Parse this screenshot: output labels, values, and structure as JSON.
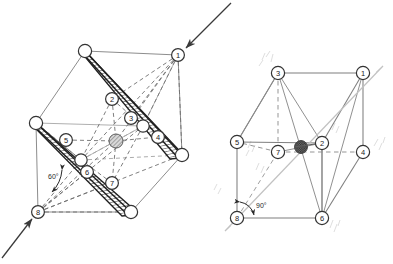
{
  "figure": {
    "background_color": "#ffffff",
    "width": 393,
    "height": 264,
    "line_color": "#555555",
    "dash_color": "#707070",
    "band_color": "#1a1a1a",
    "node_fill": "#ffffff",
    "node_stroke": "#333333",
    "center_atom_color_left": "#8a8a8a",
    "center_atom_color_right": "#4a4a4a",
    "arrow_color": "#3a3a3a"
  },
  "left_cell": {
    "name": "left-unit-cell",
    "angle_label": "60°",
    "incoming_arrow_top_label": "",
    "incoming_arrow_bottom_label": "",
    "numbered_nodes": [
      {
        "id": "1",
        "label": "1",
        "x": 178,
        "y": 55
      },
      {
        "id": "2",
        "label": "2",
        "x": 112,
        "y": 99
      },
      {
        "id": "3",
        "label": "3",
        "x": 131,
        "y": 118
      },
      {
        "id": "4",
        "label": "4",
        "x": 158,
        "y": 137
      },
      {
        "id": "5",
        "label": "5",
        "x": 66,
        "y": 140
      },
      {
        "id": "6",
        "label": "6",
        "x": 87,
        "y": 172
      },
      {
        "id": "7",
        "label": "7",
        "x": 112,
        "y": 183
      },
      {
        "id": "8",
        "label": "8",
        "x": 38,
        "y": 212
      }
    ],
    "corner_nodes": [
      {
        "id": "top",
        "x": 85,
        "y": 51
      },
      {
        "id": "upper-left",
        "x": 36,
        "y": 123
      },
      {
        "id": "right",
        "x": 182,
        "y": 155
      },
      {
        "id": "mid-right",
        "x": 143,
        "y": 126
      },
      {
        "id": "mid-left",
        "x": 81,
        "y": 160
      },
      {
        "id": "bottom",
        "x": 131,
        "y": 212
      }
    ],
    "center_atom": {
      "x": 116,
      "y": 141,
      "r": 7
    }
  },
  "right_cell": {
    "name": "right-unit-cell",
    "angle_label": "90°",
    "numbered_nodes": [
      {
        "id": "1",
        "label": "1",
        "x": 363,
        "y": 73
      },
      {
        "id": "2",
        "label": "2",
        "x": 322,
        "y": 143
      },
      {
        "id": "3",
        "label": "3",
        "x": 278,
        "y": 73
      },
      {
        "id": "4",
        "label": "4",
        "x": 363,
        "y": 152
      },
      {
        "id": "5",
        "label": "5",
        "x": 237,
        "y": 142
      },
      {
        "id": "6",
        "label": "6",
        "x": 322,
        "y": 218
      },
      {
        "id": "7",
        "label": "7",
        "x": 278,
        "y": 152
      },
      {
        "id": "8",
        "label": "8",
        "x": 237,
        "y": 218
      }
    ],
    "center_atom": {
      "x": 301,
      "y": 147,
      "r": 6
    }
  },
  "annotations": {
    "left_angle": "60°",
    "right_angle": "90°"
  }
}
